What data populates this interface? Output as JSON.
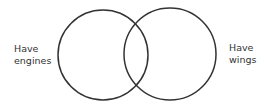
{
  "diagram": {
    "type": "venn",
    "stroke_color": "#333333",
    "sets": [
      {
        "id": "left",
        "label_lines": [
          "Have",
          "engines"
        ],
        "circle": {
          "cx": 103,
          "cy": 55,
          "r": 45
        }
      },
      {
        "id": "right",
        "label_lines": [
          "Have",
          "wings"
        ],
        "circle": {
          "cx": 170,
          "cy": 54,
          "r": 46
        }
      }
    ]
  }
}
